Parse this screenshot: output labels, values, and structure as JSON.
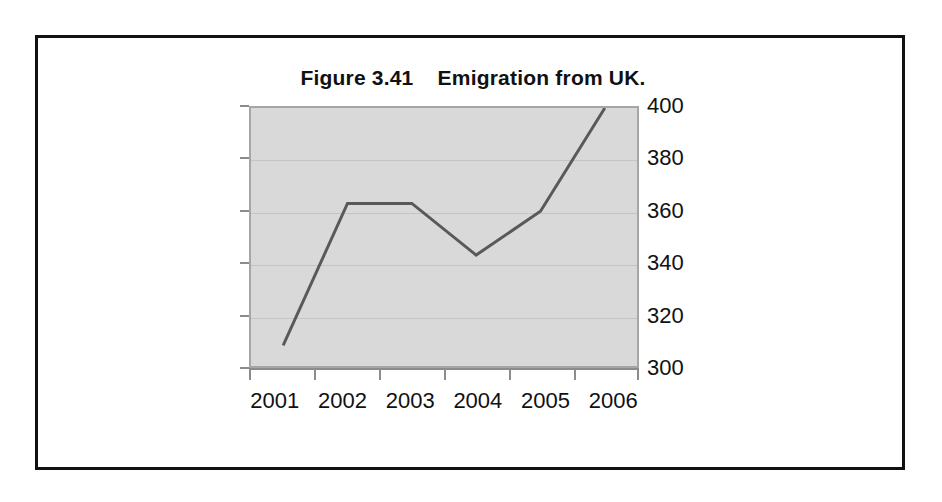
{
  "figure": {
    "title": "Figure 3.41    Emigration from UK.",
    "frame_color": "#111111",
    "background_color": "#ffffff"
  },
  "chart_data": {
    "type": "line",
    "title": "Figure 3.41    Emigration from UK.",
    "xlabel": "",
    "ylabel": "",
    "categories": [
      "2001",
      "2002",
      "2003",
      "2004",
      "2005",
      "2006"
    ],
    "values": [
      308,
      363,
      363,
      343,
      360,
      400
    ],
    "series": [
      {
        "name": "Emigration from UK",
        "values": [
          308,
          363,
          363,
          343,
          360,
          400
        ]
      }
    ],
    "ylim": [
      300,
      400
    ],
    "y_ticks": [
      300,
      320,
      340,
      360,
      380,
      400
    ],
    "y_tick_labels": [
      "300",
      "320",
      "340",
      "360",
      "380",
      "400"
    ],
    "y_axis_position": "right",
    "x_axis_position": "bottom",
    "grid": true,
    "grid_axis": "y",
    "legend": false,
    "legend_position": "none",
    "markers": false,
    "line_color": "#595959",
    "line_width": 3,
    "plot_background_color": "#d9d9d9",
    "plot_border_color": "#a6a6a6",
    "gridline_color": "#c4c4c4",
    "tick_color": "#8c8c8c",
    "text_color": "#111111"
  }
}
